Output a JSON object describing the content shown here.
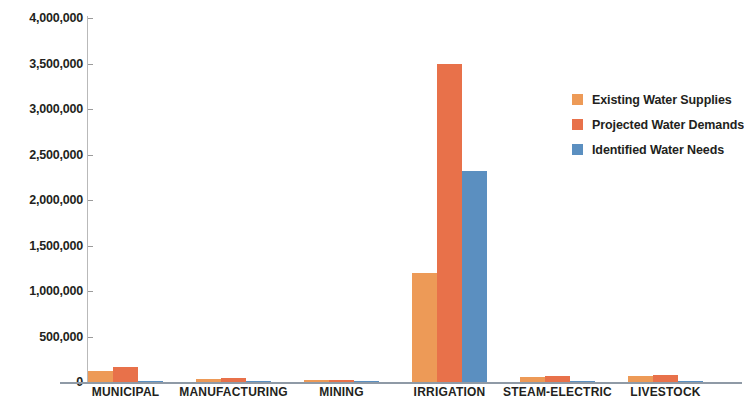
{
  "chart_data": {
    "type": "bar",
    "title": "",
    "xlabel": "",
    "ylabel": "",
    "ylim": [
      0,
      4000000
    ],
    "ytick_step": 500000,
    "grid": false,
    "legend_position": "right",
    "categories": [
      "MUNICIPAL",
      "MANUFACTURING",
      "MINING",
      "IRRIGATION",
      "STEAM-ELECTRIC",
      "LIVESTOCK"
    ],
    "ytick_labels": [
      "4,000,000",
      "3,500,000",
      "3,000,000",
      "2,500,000",
      "2,000,000",
      "1,500,000",
      "1,000,000",
      "500,000",
      "0"
    ],
    "ytick_values": [
      4000000,
      3500000,
      3000000,
      2500000,
      2000000,
      1500000,
      1000000,
      500000,
      0
    ],
    "series": [
      {
        "name": "Existing Water Supplies",
        "color": "#ED9A57",
        "values": [
          120000,
          35000,
          18000,
          1200000,
          60000,
          70000
        ]
      },
      {
        "name": "Projected Water Demands",
        "color": "#E8714A",
        "values": [
          165000,
          40000,
          22000,
          3500000,
          65000,
          78000
        ]
      },
      {
        "name": "Identified Water Needs",
        "color": "#5B8FC0",
        "values": [
          15000,
          5000,
          4000,
          2320000,
          8000,
          9000
        ]
      }
    ]
  },
  "axis": {
    "baseline_label": "0"
  }
}
